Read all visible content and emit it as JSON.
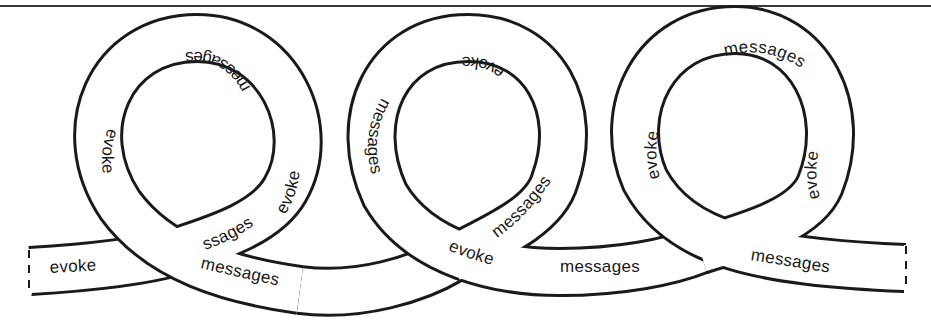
{
  "figure": {
    "labels": {
      "tail_left": "evoke",
      "loop1_top": "messages",
      "loop1_left": "evoke",
      "loop1_right": "evoke",
      "loop1_inner_fragment": "ssages",
      "loop1_bottom": "messages",
      "loop2_top": "evoke",
      "loop2_left": "messages",
      "loop2_inner": "messages",
      "loop2_bottom": "evoke",
      "between_2_3": "messages",
      "loop3_top": "messages",
      "loop3_left": "evoke",
      "loop3_right": "evoke",
      "tail_right": "messages"
    },
    "colors": {
      "ink": "#1a1a1a",
      "band": "#ffffff",
      "rule": "#3a3a3a"
    }
  }
}
